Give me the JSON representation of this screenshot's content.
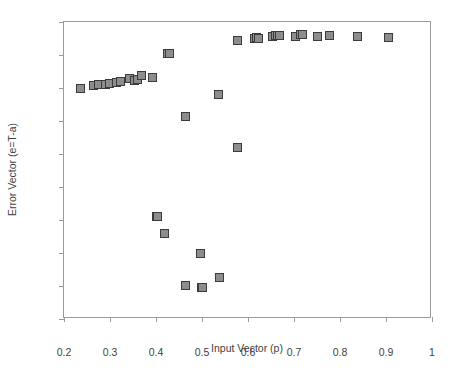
{
  "chart_data": {
    "type": "scatter",
    "title": "",
    "xlabel": "Input Vector (p)",
    "ylabel": "Error Vector (e=T-a)",
    "xlim": [
      0.2,
      1.0
    ],
    "ylim": [
      -0.09,
      0.0
    ],
    "xticks": [
      0.2,
      0.3,
      0.4,
      0.5,
      0.6,
      0.7,
      0.8,
      0.9,
      1.0
    ],
    "xticklabels": [
      "0.2",
      "0.3",
      "0.4",
      "0.5",
      "0.6",
      "0.7",
      "0.8",
      "0.9",
      "1"
    ],
    "yticks": [
      0.0,
      -0.01,
      -0.02,
      -0.03,
      -0.04,
      -0.05,
      -0.06,
      -0.07,
      -0.08,
      -0.09
    ],
    "yticklabels": [
      "0",
      "-0.01",
      "-0.02",
      "-0.03",
      "-0.04",
      "-0.05",
      "-0.06",
      "-0.07",
      "-0.08",
      "-0.09"
    ],
    "grid": false,
    "legend": null,
    "marker": {
      "shape": "square",
      "fill_color": "#8d8d8d",
      "edge_color": "#3b3b3b",
      "size_px": 7
    },
    "series": [
      {
        "name": "error",
        "x": [
          0.233,
          0.263,
          0.272,
          0.288,
          0.296,
          0.313,
          0.32,
          0.341,
          0.351,
          0.358,
          0.367,
          0.39,
          0.398,
          0.4,
          0.416,
          0.423,
          0.427,
          0.461,
          0.462,
          0.494,
          0.497,
          0.498,
          0.534,
          0.536,
          0.574,
          0.576,
          0.611,
          0.617,
          0.62,
          0.65,
          0.657,
          0.662,
          0.666,
          0.7,
          0.711,
          0.716,
          0.748,
          0.775,
          0.836,
          0.903
        ],
        "y": [
          -0.0197,
          -0.0188,
          -0.0187,
          -0.0186,
          -0.0183,
          -0.018,
          -0.0177,
          -0.0167,
          -0.0173,
          -0.017,
          -0.0159,
          -0.0166,
          -0.0585,
          -0.0585,
          -0.0637,
          -0.0092,
          -0.0091,
          -0.0282,
          -0.0795,
          -0.0698,
          -0.08,
          -0.08,
          -0.0218,
          -0.077,
          -0.0052,
          -0.0376,
          -0.0046,
          -0.0045,
          -0.0048,
          -0.0041,
          -0.0038,
          -0.0038,
          -0.0037,
          -0.0041,
          -0.0035,
          -0.0036,
          -0.0041,
          -0.0039,
          -0.0041,
          -0.0044
        ]
      }
    ]
  }
}
